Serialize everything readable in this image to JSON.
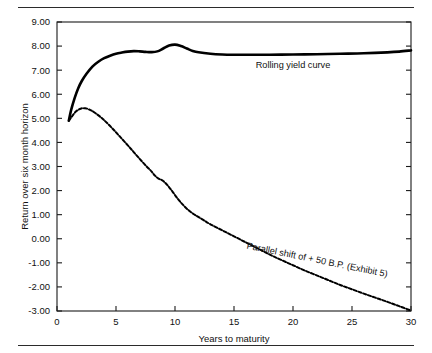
{
  "chart_data": {
    "type": "line",
    "title": "",
    "subtitle": "",
    "xlabel": "Years to maturity",
    "ylabel": "Return over six month horizon",
    "xlim": [
      0,
      30
    ],
    "ylim": [
      -3.0,
      9.0
    ],
    "xticks": [
      "0",
      "5",
      "10",
      "15",
      "20",
      "25",
      "30"
    ],
    "xtick_values": [
      0,
      5,
      10,
      15,
      20,
      25,
      30
    ],
    "yticks": [
      "9.00",
      "8.00",
      "7.00",
      "6.00",
      "5.00",
      "4.00",
      "3.00",
      "2.00",
      "1.00",
      "0.00",
      "-1.00",
      "-2.00",
      "-3.00"
    ],
    "ytick_values": [
      9,
      8,
      7,
      6,
      5,
      4,
      3,
      2,
      1,
      0,
      -1,
      -2,
      -3
    ],
    "grid": false,
    "legend_position": "inline-annotations",
    "series": [
      {
        "name": "Rolling yield curve",
        "style": "solid",
        "color": "#000000",
        "x": [
          1.0,
          1.2,
          1.5,
          1.8,
          2.1,
          2.5,
          3.0,
          3.5,
          4.0,
          4.5,
          5.0,
          5.5,
          6.0,
          6.5,
          7.0,
          7.5,
          8.0,
          8.5,
          9.0,
          9.5,
          10.0,
          10.5,
          11.0,
          11.5,
          12.0,
          13.0,
          14.0,
          15.0,
          16.0,
          18.0,
          20.0,
          22.0,
          24.0,
          26.0,
          28.0,
          29.0,
          30.0
        ],
        "y": [
          4.9,
          5.35,
          5.85,
          6.25,
          6.55,
          6.85,
          7.15,
          7.35,
          7.5,
          7.6,
          7.68,
          7.73,
          7.77,
          7.79,
          7.78,
          7.76,
          7.75,
          7.78,
          7.9,
          8.02,
          8.06,
          8.0,
          7.9,
          7.8,
          7.74,
          7.68,
          7.65,
          7.64,
          7.64,
          7.64,
          7.65,
          7.66,
          7.68,
          7.7,
          7.74,
          7.77,
          7.82
        ]
      },
      {
        "name": "Parallel shift of + 50 B.P. (Exhibit 5)",
        "style": "dashed",
        "color": "#000000",
        "x": [
          1.0,
          1.3,
          1.6,
          2.0,
          2.4,
          2.8,
          3.0,
          3.3,
          3.7,
          4.0,
          4.5,
          5.0,
          5.5,
          6.0,
          6.5,
          7.0,
          7.5,
          8.0,
          8.3,
          8.6,
          9.0,
          9.4,
          9.8,
          10.2,
          10.6,
          11.0,
          11.5,
          12.0,
          12.5,
          13.0,
          14.0,
          15.0,
          16.0,
          17.0,
          18.0,
          19.0,
          20.0,
          21.0,
          22.0,
          23.0,
          24.0,
          25.0,
          26.0,
          27.0,
          28.0,
          29.0,
          30.0
        ],
        "y": [
          4.9,
          5.1,
          5.28,
          5.4,
          5.42,
          5.35,
          5.3,
          5.2,
          5.05,
          4.92,
          4.68,
          4.42,
          4.15,
          3.88,
          3.6,
          3.32,
          3.05,
          2.8,
          2.62,
          2.5,
          2.4,
          2.2,
          1.95,
          1.68,
          1.45,
          1.25,
          1.05,
          0.9,
          0.75,
          0.6,
          0.35,
          0.1,
          -0.15,
          -0.4,
          -0.65,
          -0.88,
          -1.1,
          -1.32,
          -1.52,
          -1.72,
          -1.92,
          -2.1,
          -2.28,
          -2.45,
          -2.62,
          -2.8,
          -2.98
        ]
      }
    ],
    "annotations": [
      {
        "text": "Rolling yield curve",
        "x": 20.0,
        "y": 7.1,
        "rotation": 0
      },
      {
        "text": "Parallel shift of + 50 B.P. (Exhibit 5)",
        "x": 22.0,
        "y": -1.0,
        "rotation": 11.5
      }
    ]
  }
}
